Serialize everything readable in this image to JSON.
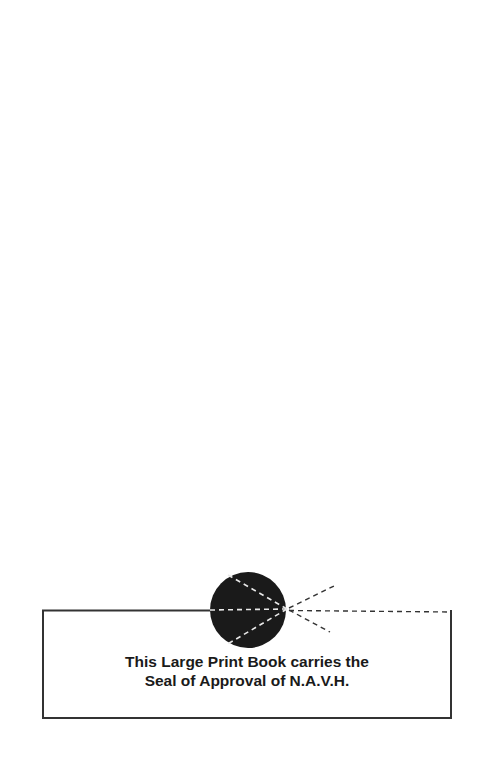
{
  "seal": {
    "line1": "This Large Print Book carries the",
    "line2": "Seal of Approval of N.A.V.H.",
    "circle_color": "#1a1a1a",
    "line_color": "#333333"
  }
}
